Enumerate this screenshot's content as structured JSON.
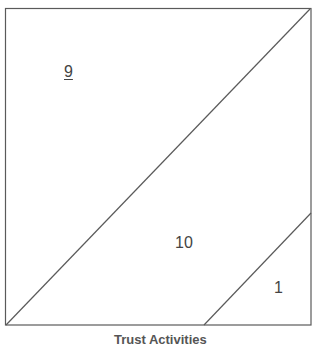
{
  "diagram": {
    "type": "partitioned-square",
    "frame": {
      "x1": 5,
      "y1": 8,
      "x2": 311,
      "y2": 325
    },
    "line_color": "#5a5a5a",
    "dividers": [
      {
        "name": "main-diagonal",
        "x1": 6,
        "y1": 325,
        "x2": 310,
        "y2": 9
      },
      {
        "name": "lower-diagonal",
        "x1": 204,
        "y1": 325,
        "x2": 311,
        "y2": 213
      }
    ],
    "regions": [
      {
        "id": "upper-left",
        "label": "9",
        "underlined": true
      },
      {
        "id": "middle",
        "label": "10",
        "underlined": false
      },
      {
        "id": "lower-right",
        "label": "1",
        "underlined": false
      }
    ],
    "x_axis_label": "Trust Activities"
  }
}
